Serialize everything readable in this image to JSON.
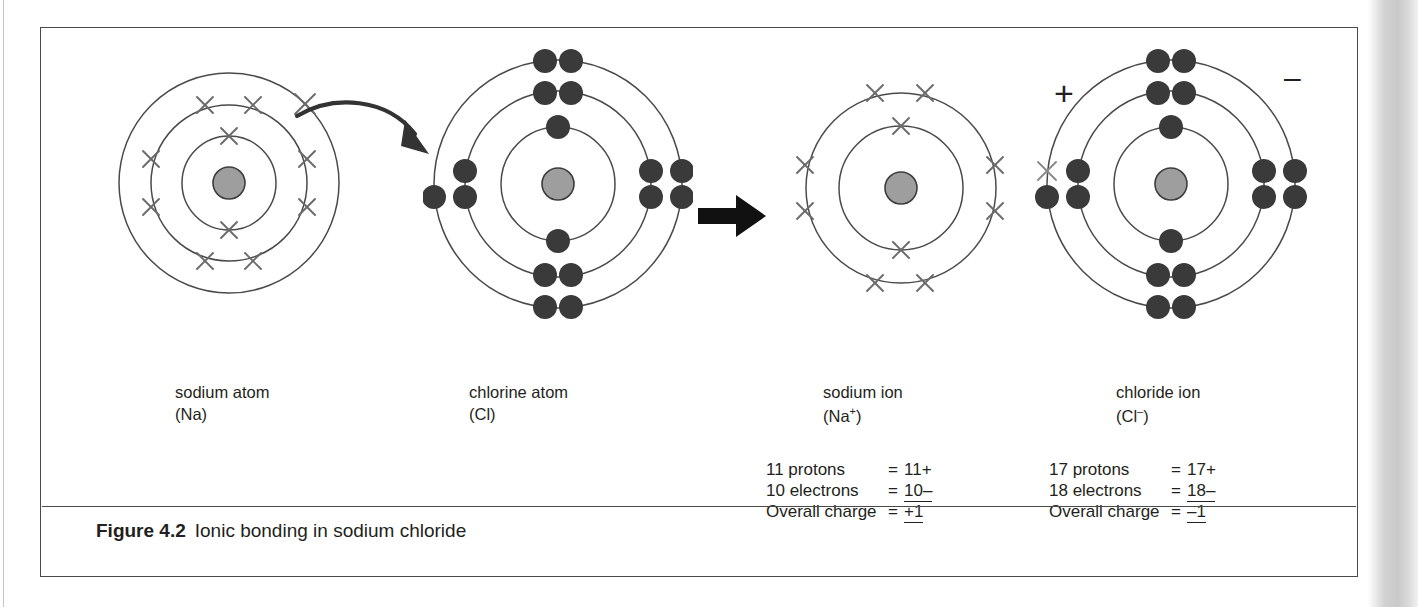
{
  "figure": {
    "label": "Figure 4.2",
    "caption": "Ionic bonding in sodium chloride",
    "border_color": "#4a4a4a"
  },
  "colors": {
    "nucleus_fill": "#9e9e9e",
    "nucleus_stroke": "#333333",
    "shell_stroke": "#4a4a4a",
    "electron_dot": "#3a3a3a",
    "electron_cross": "#6b6b6b",
    "text": "#231f20",
    "arrow": "#1a1a1a"
  },
  "diagram": {
    "type": "atomic-shell-diagram",
    "reaction": "Na + Cl -> Na+ + Cl-",
    "transfer_arrow": {
      "name": "electron-transfer-arrow",
      "from": "sodium outer shell electron",
      "to": "chlorine outer shell"
    },
    "reaction_arrow": {
      "name": "reaction-arrow",
      "direction": "right"
    },
    "species": [
      {
        "id": "sodium-atom",
        "name": "sodium atom",
        "symbol": "(Na)",
        "charge_sign": "",
        "electron_marker": "cross",
        "shell_counts": [
          2,
          8,
          1
        ],
        "total_electrons": 11,
        "protons": 11
      },
      {
        "id": "chlorine-atom",
        "name": "chlorine atom",
        "symbol": "(Cl)",
        "charge_sign": "",
        "electron_marker": "dot",
        "shell_counts": [
          2,
          8,
          7
        ],
        "total_electrons": 17,
        "protons": 17
      },
      {
        "id": "sodium-ion",
        "name": "sodium ion",
        "symbol": "(Na+)",
        "charge_sign": "+",
        "electron_marker": "cross",
        "shell_counts": [
          2,
          8
        ],
        "total_electrons": 10,
        "protons": 11
      },
      {
        "id": "chloride-ion",
        "name": "chloride ion",
        "symbol": "(Cl-)",
        "charge_sign": "–",
        "electron_marker": "dot",
        "shell_counts": [
          2,
          8,
          8
        ],
        "total_electrons": 18,
        "protons": 17,
        "transferred_electron_marker": "cross"
      }
    ]
  },
  "calculations": [
    {
      "id": "sodium-ion-charge-calc",
      "rows": [
        {
          "label": "11 protons",
          "eq": "=",
          "value": "11+",
          "underline": false
        },
        {
          "label": "10 electrons",
          "eq": "=",
          "value": "10–",
          "underline": true
        },
        {
          "label": "Overall charge",
          "eq": "=",
          "value": "+1",
          "underline": true
        }
      ]
    },
    {
      "id": "chloride-ion-charge-calc",
      "rows": [
        {
          "label": "17 protons",
          "eq": "=",
          "value": "17+",
          "underline": false
        },
        {
          "label": "18 electrons",
          "eq": "=",
          "value": "18–",
          "underline": true
        },
        {
          "label": "Overall charge",
          "eq": "=",
          "value": "–1",
          "underline": true
        }
      ]
    }
  ],
  "labels": {
    "sodium_atom_line1": "sodium atom",
    "sodium_atom_line2": "(Na)",
    "chlorine_atom_line1": "chlorine atom",
    "chlorine_atom_line2": "(Cl)",
    "sodium_ion_line1": "sodium ion",
    "sodium_ion_line2_pre": "(Na",
    "sodium_ion_line2_sup": "+",
    "sodium_ion_line2_post": ")",
    "chloride_ion_line1": "chloride ion",
    "chloride_ion_line2_pre": "(Cl",
    "chloride_ion_line2_sup": "–",
    "chloride_ion_line2_post": ")",
    "sodium_ion_charge": "+",
    "chloride_ion_charge": "–"
  }
}
